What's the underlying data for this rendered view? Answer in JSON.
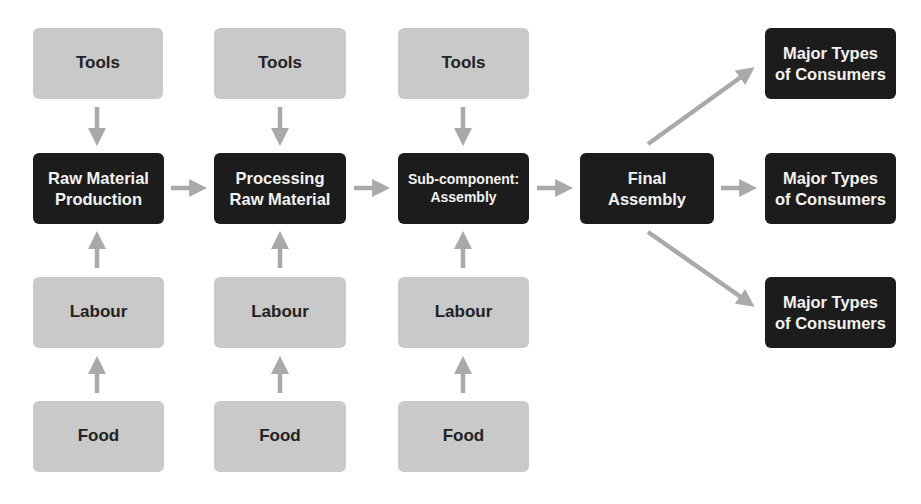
{
  "diagram": {
    "type": "supply-chain-flow",
    "colors": {
      "input_box": "#c9c9c9",
      "process_box": "#1c1c1c",
      "arrow": "#a9a9a9",
      "input_text": "#222222",
      "process_text": "#f2f2f2"
    },
    "columns": [
      {
        "tools": "Tools",
        "stage": "Raw Material\nProduction",
        "labour": "Labour",
        "food": "Food"
      },
      {
        "tools": "Tools",
        "stage": "Processing\nRaw Material",
        "labour": "Labour",
        "food": "Food"
      },
      {
        "tools": "Tools",
        "stage": "Sub-component:\nAssembly",
        "labour": "Labour",
        "food": "Food"
      }
    ],
    "final": "Final\nAssembly",
    "consumers": [
      "Major Types\nof Consumers",
      "Major Types\nof Consumers",
      "Major Types\nof Consumers"
    ],
    "edges": [
      [
        "Tools (1)",
        "Raw Material Production"
      ],
      [
        "Labour (1)",
        "Raw Material Production"
      ],
      [
        "Food (1)",
        "Labour (1)"
      ],
      [
        "Tools (2)",
        "Processing Raw Material"
      ],
      [
        "Labour (2)",
        "Processing Raw Material"
      ],
      [
        "Food (2)",
        "Labour (2)"
      ],
      [
        "Tools (3)",
        "Sub-component: Assembly"
      ],
      [
        "Labour (3)",
        "Sub-component: Assembly"
      ],
      [
        "Food (3)",
        "Labour (3)"
      ],
      [
        "Raw Material Production",
        "Processing Raw Material"
      ],
      [
        "Processing Raw Material",
        "Sub-component: Assembly"
      ],
      [
        "Sub-component: Assembly",
        "Final Assembly"
      ],
      [
        "Final Assembly",
        "Major Types of Consumers (top)"
      ],
      [
        "Final Assembly",
        "Major Types of Consumers (middle)"
      ],
      [
        "Final Assembly",
        "Major Types of Consumers (bottom)"
      ]
    ]
  }
}
